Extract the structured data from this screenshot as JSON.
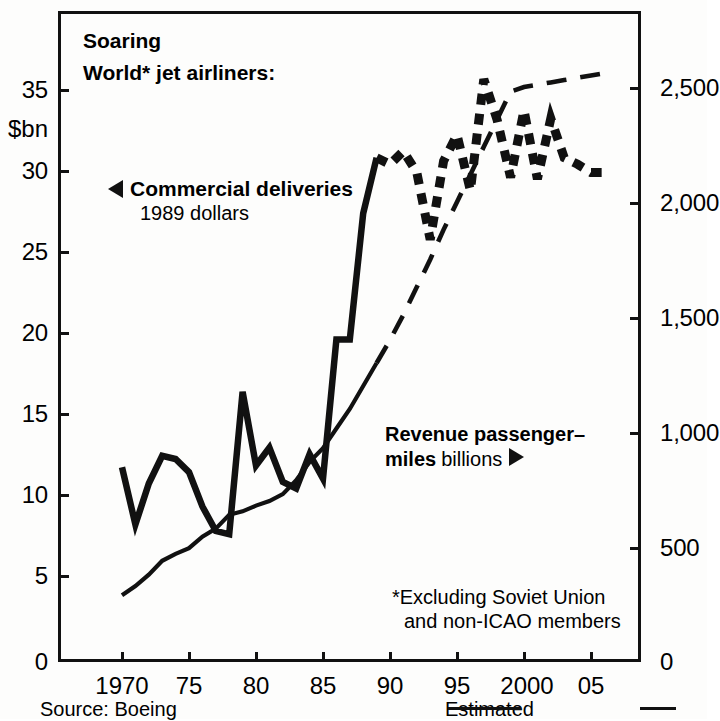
{
  "chart_data": {
    "type": "line",
    "title": "Soaring",
    "subtitle": "World* jet airliners:",
    "source": "Source: Boeing",
    "estimated_label": "Estimated",
    "footnote_line1": "*Excluding Soviet Union",
    "footnote_line2": "and non-ICAO members",
    "xlabel": "",
    "x": [
      1970,
      1971,
      1972,
      1973,
      1974,
      1975,
      1976,
      1977,
      1978,
      1979,
      1980,
      1981,
      1982,
      1983,
      1984,
      1985,
      1986,
      1987,
      1988,
      1989,
      1990,
      1991,
      1992,
      1993,
      1994,
      1995,
      1996,
      1997,
      1998,
      1999,
      2000,
      2001,
      2002,
      2003,
      2004,
      2005,
      2006
    ],
    "xticks": [
      "1970",
      "75",
      "80",
      "85",
      "90",
      "95",
      "2000",
      "05"
    ],
    "xtick_values": [
      1970,
      1975,
      1980,
      1985,
      1990,
      1995,
      2000,
      2005
    ],
    "xlim": [
      1969.2,
      2006.5
    ],
    "left_axis": {
      "label": "$bn",
      "ticks": [
        0,
        5,
        10,
        15,
        20,
        25,
        30,
        35
      ],
      "ticklabels": [
        "0",
        "5",
        "10",
        "15",
        "20",
        "25",
        "30",
        "35"
      ],
      "lim": [
        0,
        37.5
      ]
    },
    "right_axis": {
      "label": "billions",
      "ticks": [
        0,
        500,
        1000,
        1500,
        2000,
        2500
      ],
      "ticklabels": [
        "0",
        "500",
        "1,000",
        "1,500",
        "2,000",
        "2,500"
      ],
      "lim": [
        0,
        2680
      ]
    },
    "series": [
      {
        "name": "Commercial deliveries",
        "sublabel": "1989 dollars",
        "units": "$bn (1989 dollars)",
        "axis": "left",
        "marker": "left-triangle",
        "color": "#111111",
        "solid_until": 1989,
        "values": [
          11.9,
          8.4,
          10.9,
          12.6,
          12.4,
          11.6,
          9.5,
          8.0,
          7.8,
          16.5,
          12.0,
          13.1,
          11.0,
          10.6,
          12.7,
          11.2,
          19.7,
          19.7,
          27.4,
          30.8,
          30.4,
          31.2,
          29.9,
          25.8,
          30.6,
          32.2,
          28.8,
          35.6,
          33.1,
          29.6,
          33.7,
          29.5,
          33.2,
          30.8,
          30.4,
          29.9,
          29.9
        ]
      },
      {
        "name": "Revenue passenger-miles",
        "sublabel": "billions",
        "units": "billions",
        "axis": "right",
        "marker": "right-triangle",
        "color": "#111111",
        "solid_until": 1989,
        "values": [
          290,
          330,
          380,
          440,
          470,
          495,
          545,
          580,
          640,
          655,
          680,
          700,
          730,
          790,
          870,
          930,
          1015,
          1100,
          1200,
          1300,
          1400,
          1510,
          1630,
          1750,
          1880,
          2000,
          2120,
          2240,
          2360,
          2480,
          2500,
          2510,
          2520,
          2530,
          2540,
          2550,
          2560
        ]
      }
    ],
    "annotations": [
      {
        "text": "Commercial deliveries",
        "sub": "1989 dollars",
        "arrow": "left"
      },
      {
        "text": "Revenue passenger–",
        "sub": "miles billions",
        "arrow": "right"
      }
    ],
    "grid": false,
    "legend_position": "inline-annotations"
  },
  "header": {
    "title": "Soaring",
    "subtitle": "World* jet airliners:"
  },
  "left_axis_label": "$bn",
  "left_ticks": [
    "35",
    "30",
    "25",
    "20",
    "15",
    "10",
    "5",
    "0"
  ],
  "right_ticks": [
    "2,500",
    "2,000",
    "1,500",
    "1,000",
    "500",
    "0"
  ],
  "x_ticks": [
    "1970",
    "75",
    "80",
    "85",
    "90",
    "95",
    "2000",
    "05"
  ],
  "annotations": {
    "commercial_line1": "Commercial deliveries",
    "commercial_line2": "1989 dollars",
    "rpm_line1": "Revenue passenger–",
    "rpm_line2_bold": "miles",
    "rpm_line2_light": "billions",
    "footnote_line1": "*Excluding Soviet Union",
    "footnote_line2": "and non-ICAO members"
  },
  "footer": {
    "source": "Source: Boeing",
    "estimated": "Estimated"
  }
}
